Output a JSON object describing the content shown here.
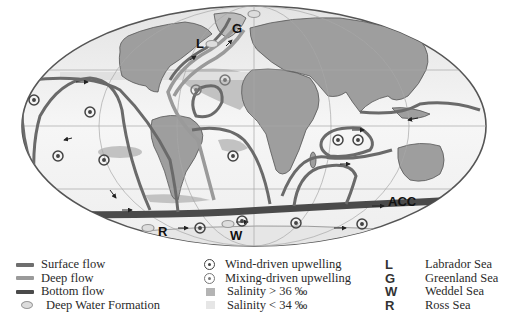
{
  "map": {
    "labels": {
      "labrador": "L",
      "greenland": "G",
      "weddel": "W",
      "ross": "R",
      "acc": "ACC"
    }
  },
  "legend": {
    "flows": [
      {
        "label": "Surface flow",
        "color": "#6e6e6e"
      },
      {
        "label": "Deep flow",
        "color": "#9a9a9a"
      },
      {
        "label": "Bottom flow",
        "color": "#4a4a4a"
      },
      {
        "label": "Deep Water Formation",
        "symbol": "oval"
      }
    ],
    "features": [
      {
        "label": "Wind-driven upwelling",
        "symbol": "ring-dark"
      },
      {
        "label": "Mixing-driven upwelling",
        "symbol": "ring-light"
      },
      {
        "label": "Salinity > 36 ‰",
        "color": "#b4b4b4"
      },
      {
        "label": "Salinity < 34 ‰",
        "color": "#e6e6e6"
      }
    ],
    "seas": [
      {
        "letter": "L",
        "label": "Labrador Sea"
      },
      {
        "letter": "G",
        "label": "Greenland Sea"
      },
      {
        "letter": "W",
        "label": "Weddel Sea"
      },
      {
        "letter": "R",
        "label": "Ross Sea"
      }
    ]
  },
  "colors": {
    "ocean": "#f4f4f4",
    "land": "#9c9c9c",
    "grid": "#b0b0b0",
    "salinity_high": "#bdbdbd",
    "salinity_low": "#e8e8e8"
  }
}
